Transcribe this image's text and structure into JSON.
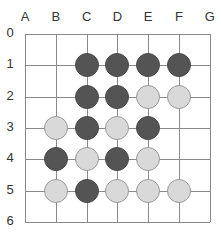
{
  "board": {
    "columns": [
      "A",
      "B",
      "C",
      "D",
      "E",
      "F",
      "G"
    ],
    "rows": [
      "0",
      "1",
      "2",
      "3",
      "4",
      "5",
      "6"
    ],
    "colors": {
      "black": "#545454",
      "white": "#d9d9d9",
      "grid": "#8a8a8a"
    },
    "stones": [
      {
        "col": "C",
        "row": 1,
        "color": "black"
      },
      {
        "col": "D",
        "row": 1,
        "color": "black"
      },
      {
        "col": "E",
        "row": 1,
        "color": "black"
      },
      {
        "col": "F",
        "row": 1,
        "color": "black"
      },
      {
        "col": "C",
        "row": 2,
        "color": "black"
      },
      {
        "col": "D",
        "row": 2,
        "color": "black"
      },
      {
        "col": "E",
        "row": 2,
        "color": "white"
      },
      {
        "col": "F",
        "row": 2,
        "color": "white"
      },
      {
        "col": "B",
        "row": 3,
        "color": "white"
      },
      {
        "col": "C",
        "row": 3,
        "color": "black"
      },
      {
        "col": "D",
        "row": 3,
        "color": "white"
      },
      {
        "col": "E",
        "row": 3,
        "color": "black"
      },
      {
        "col": "B",
        "row": 4,
        "color": "black"
      },
      {
        "col": "C",
        "row": 4,
        "color": "white"
      },
      {
        "col": "D",
        "row": 4,
        "color": "black"
      },
      {
        "col": "E",
        "row": 4,
        "color": "white"
      },
      {
        "col": "B",
        "row": 5,
        "color": "white"
      },
      {
        "col": "C",
        "row": 5,
        "color": "black"
      },
      {
        "col": "D",
        "row": 5,
        "color": "white"
      },
      {
        "col": "E",
        "row": 5,
        "color": "white"
      },
      {
        "col": "F",
        "row": 5,
        "color": "white"
      }
    ]
  }
}
